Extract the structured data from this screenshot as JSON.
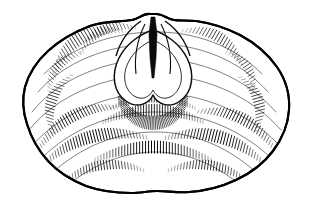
{
  "figure": {
    "title": "Fossil bivalve shell, exterior of left valve",
    "subject_name": "shell-valve-exterior",
    "technique": "pen-and-ink line drawing with parallel hatching",
    "orientation": "exterior view, umbo at top centre",
    "canvas": {
      "width": 311,
      "height": 211
    },
    "colors": {
      "background": "#ffffff",
      "ink": "#000000",
      "hatch_ink": "#0a0a0a",
      "outline": "#000000"
    },
    "outline": {
      "name": "shell-margin",
      "description": "broad ovate to sub-circular valve margin, slightly wavy ventral edge, widest across the middle",
      "bounds": {
        "left": 22,
        "top": 13,
        "right": 290,
        "bottom": 194
      },
      "path": "M 150 14 C 143 13 139 19 132 20 C 118 22 104 21 90 26 C 74 32 60 40 48 51 C 37 61 29 73 25 87 C 22 99 23 112 27 124 C 31 137 38 150 48 161 C 58 172 71 180 86 186 C 100 191 115 193 131 193 C 141 193 148 191 157 191 C 168 191 177 193 189 192 C 205 191 221 187 236 180 C 251 173 264 163 273 151 C 282 139 288 125 289 110 C 290 95 286 80 277 67 C 268 54 255 43 240 35 C 226 28 211 23 196 21 C 186 20 180 21 174 20 C 167 19 163 14 156 14 Z"
    },
    "features": [
      {
        "name": "beak-umbo",
        "label": "beak / umbo",
        "position": {
          "x": 153,
          "y": 15
        },
        "description": "pointed apex at top centre with paired shoulders"
      },
      {
        "name": "delthyrium-cleft",
        "label": "delthyrium cleft",
        "position": {
          "x": 153,
          "y": 45
        },
        "description": "narrow dark vertical cleft descending from the beak"
      },
      {
        "name": "cardinal-heart-area",
        "label": "cordate cardinal area",
        "position": {
          "x": 153,
          "y": 78
        },
        "description": "heart-shaped bilobed depression below the beak, bordered by dense radiating hatching"
      },
      {
        "name": "growth-band-zone",
        "label": "concentric growth bands",
        "position": {
          "x": 153,
          "y": 140
        },
        "description": "broad arcuate hatched bands concentric with the ventral margin"
      }
    ],
    "growth_lines": [
      "M 44 74 C 70 48 110 33 152 32 C 196 31 236 47 262 74",
      "M 38 92 C 64 62 108 45 152 44 C 198 43 240 60 268 92",
      "M 32 112 C 58 79 106 60 152 59 C 200 58 246 78 276 112",
      "M 29 130 C 56 96 104 76 152 75 C 202 74 250 95 281 130",
      "M 30 148 C 58 115 104 94 152 93 C 202 92 250 113 282 148",
      "M 36 164 C 64 133 106 113 152 112 C 200 111 246 131 277 164",
      "M 47 178 C 74 151 110 133 152 132 C 196 131 234 150 262 178",
      "M 64 188 C 88 168 118 153 152 152 C 188 151 220 167 244 188"
    ],
    "hatch_bands": [
      {
        "name": "band-upper-left-a",
        "cx": 88,
        "cy": 52,
        "rx": 40,
        "ry": 16,
        "rot": -32,
        "count": 26,
        "len": 13,
        "weight": 0.85,
        "gap": 2.4
      },
      {
        "name": "band-upper-left-b",
        "cx": 108,
        "cy": 40,
        "rx": 30,
        "ry": 11,
        "rot": -24,
        "count": 20,
        "len": 10,
        "weight": 0.8,
        "gap": 2.3
      },
      {
        "name": "band-upper-left-c",
        "cx": 66,
        "cy": 72,
        "rx": 26,
        "ry": 10,
        "rot": -48,
        "count": 18,
        "len": 10,
        "weight": 0.75,
        "gap": 2.3
      },
      {
        "name": "band-upper-right-a",
        "cx": 212,
        "cy": 48,
        "rx": 34,
        "ry": 13,
        "rot": 30,
        "count": 22,
        "len": 11,
        "weight": 0.8,
        "gap": 2.4
      },
      {
        "name": "band-upper-right-b",
        "cx": 240,
        "cy": 72,
        "rx": 24,
        "ry": 9,
        "rot": 56,
        "count": 16,
        "len": 9,
        "weight": 0.7,
        "gap": 2.4
      },
      {
        "name": "band-mid-left-a",
        "cx": 62,
        "cy": 104,
        "rx": 30,
        "ry": 11,
        "rot": -72,
        "count": 20,
        "len": 11,
        "weight": 0.8,
        "gap": 2.4
      },
      {
        "name": "band-mid-left-b",
        "cx": 78,
        "cy": 128,
        "rx": 44,
        "ry": 13,
        "rot": -28,
        "count": 30,
        "len": 12,
        "weight": 0.95,
        "gap": 2.3
      },
      {
        "name": "band-mid-right-a",
        "cx": 248,
        "cy": 104,
        "rx": 28,
        "ry": 11,
        "rot": 74,
        "count": 19,
        "len": 11,
        "weight": 0.8,
        "gap": 2.4
      },
      {
        "name": "band-mid-right-b",
        "cx": 236,
        "cy": 130,
        "rx": 42,
        "ry": 13,
        "rot": 26,
        "count": 28,
        "len": 12,
        "weight": 0.95,
        "gap": 2.3
      },
      {
        "name": "band-lower-left-a",
        "cx": 96,
        "cy": 150,
        "rx": 52,
        "ry": 14,
        "rot": -14,
        "count": 36,
        "len": 13,
        "weight": 1.0,
        "gap": 2.3
      },
      {
        "name": "band-lower-right-a",
        "cx": 214,
        "cy": 150,
        "rx": 50,
        "ry": 14,
        "rot": 14,
        "count": 34,
        "len": 13,
        "weight": 1.0,
        "gap": 2.3
      },
      {
        "name": "band-ventral-centre",
        "cx": 153,
        "cy": 160,
        "rx": 58,
        "ry": 13,
        "rot": 0,
        "count": 40,
        "len": 13,
        "weight": 1.0,
        "gap": 2.3
      },
      {
        "name": "band-ventral-left-low",
        "cx": 104,
        "cy": 176,
        "rx": 40,
        "ry": 11,
        "rot": -8,
        "count": 28,
        "len": 10,
        "weight": 0.85,
        "gap": 2.3
      },
      {
        "name": "band-ventral-right-low",
        "cx": 208,
        "cy": 176,
        "rx": 40,
        "ry": 11,
        "rot": 8,
        "count": 28,
        "len": 10,
        "weight": 0.85,
        "gap": 2.3
      },
      {
        "name": "band-sub-cardinal",
        "cx": 153,
        "cy": 122,
        "rx": 50,
        "ry": 12,
        "rot": 0,
        "count": 38,
        "len": 12,
        "weight": 0.9,
        "gap": 2.2
      },
      {
        "name": "band-cardinal-skirt",
        "cx": 153,
        "cy": 108,
        "rx": 42,
        "ry": 10,
        "rot": 0,
        "count": 34,
        "len": 9,
        "weight": 0.8,
        "gap": 2.1
      }
    ],
    "radial_hatch": [
      {
        "name": "radial-cardinal-rim",
        "cx": 153,
        "cy": 80,
        "r_inner": 30,
        "r_outer": 44,
        "a_start": 200,
        "a_end": 340,
        "count": 64,
        "weight": 0.7
      },
      {
        "name": "radial-cardinal-lower",
        "cx": 153,
        "cy": 84,
        "r_inner": 32,
        "r_outer": 46,
        "a_start": 20,
        "a_end": 160,
        "count": 60,
        "weight": 0.7
      },
      {
        "name": "radial-inner-lobe",
        "cx": 153,
        "cy": 78,
        "r_inner": 18,
        "r_outer": 28,
        "a_start": 200,
        "a_end": 340,
        "count": 44,
        "weight": 0.55
      }
    ]
  }
}
